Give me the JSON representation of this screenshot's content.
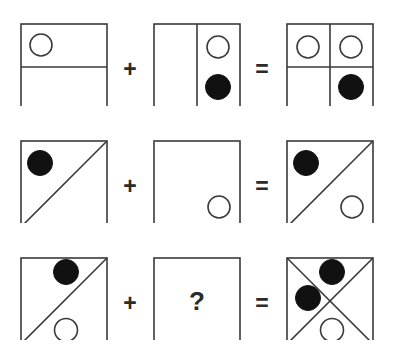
{
  "diagram": {
    "type": "matrix-reasoning-puzzle",
    "colors": {
      "background": "#ffffff",
      "stroke": "#3a3a3a",
      "fill_dark": "#111111",
      "fill_light": "#ffffff",
      "text": "#2b2b2b"
    },
    "geometry": {
      "square_size": 86,
      "stroke_width": 1.6,
      "circle_radius_open": 11,
      "circle_radius_filled": 12,
      "column_x": [
        20,
        153,
        286
      ],
      "row_y": [
        24,
        141,
        258
      ]
    },
    "operators": {
      "plus": "+",
      "equals": "=",
      "unknown": "?"
    },
    "rows": [
      {
        "id": "row-1",
        "operand_a": {
          "name": "square-half-horizontal-with-open-circle",
          "dividers": [
            "horizontal"
          ],
          "circles": [
            {
              "shape": "open-circle",
              "cx": 0.25,
              "cy": 0.25
            }
          ]
        },
        "operator": "+",
        "operand_b": {
          "name": "square-half-vertical-with-two-circles",
          "dividers": [
            "vertical"
          ],
          "circles": [
            {
              "shape": "open-circle",
              "cx": 0.75,
              "cy": 0.27
            },
            {
              "shape": "filled-circle",
              "cx": 0.75,
              "cy": 0.73
            }
          ]
        },
        "equals": "=",
        "result": {
          "name": "square-quadrants-with-three-circles",
          "dividers": [
            "horizontal",
            "vertical"
          ],
          "circles": [
            {
              "shape": "open-circle",
              "cx": 0.25,
              "cy": 0.27
            },
            {
              "shape": "open-circle",
              "cx": 0.75,
              "cy": 0.27
            },
            {
              "shape": "filled-circle",
              "cx": 0.75,
              "cy": 0.73
            }
          ]
        }
      },
      {
        "id": "row-2",
        "operand_a": {
          "name": "square-diagonal-with-filled-circle",
          "dividers": [
            "diagonal-up"
          ],
          "circles": [
            {
              "shape": "filled-circle",
              "cx": 0.24,
              "cy": 0.26
            }
          ]
        },
        "operator": "+",
        "operand_b": {
          "name": "square-empty-with-open-circle",
          "dividers": [],
          "circles": [
            {
              "shape": "open-circle",
              "cx": 0.76,
              "cy": 0.77
            }
          ]
        },
        "equals": "=",
        "result": {
          "name": "square-diagonal-with-two-circles",
          "dividers": [
            "diagonal-up"
          ],
          "circles": [
            {
              "shape": "filled-circle",
              "cx": 0.24,
              "cy": 0.26
            },
            {
              "shape": "open-circle",
              "cx": 0.76,
              "cy": 0.77
            }
          ]
        }
      },
      {
        "id": "row-3",
        "operand_a": {
          "name": "square-diagonal-with-filled-and-open-circle",
          "dividers": [
            "diagonal-up"
          ],
          "circles": [
            {
              "shape": "filled-circle",
              "cx": 0.53,
              "cy": 0.17
            },
            {
              "shape": "open-circle",
              "cx": 0.53,
              "cy": 0.84
            }
          ]
        },
        "operator": "+",
        "operand_b": {
          "name": "square-unknown-question-mark",
          "dividers": [],
          "circles": [],
          "label": "?"
        },
        "equals": "=",
        "result": {
          "name": "square-x-cross-with-three-circles",
          "dividers": [
            "diagonal-up",
            "diagonal-down"
          ],
          "circles": [
            {
              "shape": "filled-circle",
              "cx": 0.53,
              "cy": 0.17
            },
            {
              "shape": "filled-circle",
              "cx": 0.26,
              "cy": 0.47
            },
            {
              "shape": "open-circle",
              "cx": 0.53,
              "cy": 0.84
            }
          ]
        }
      }
    ]
  }
}
